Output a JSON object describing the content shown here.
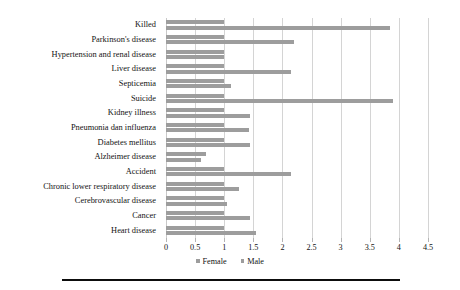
{
  "chart_data": {
    "type": "bar",
    "orientation": "horizontal",
    "title": "",
    "subtitle": "",
    "xlabel": "",
    "ylabel": "",
    "xlim": [
      0,
      4.5
    ],
    "grid": true,
    "legend_position": "bottom",
    "ticks": [
      "0",
      "0.5",
      "1",
      "1.5",
      "2",
      "2.5",
      "3",
      "3.5",
      "4",
      "4.5"
    ],
    "tick_values": [
      0,
      0.5,
      1,
      1.5,
      2,
      2.5,
      3,
      3.5,
      4,
      4.5
    ],
    "categories": [
      "Killed",
      "Parkinson's disease",
      "Hypertension and renal disease",
      "Liver disease",
      "Septicemia",
      "Suicide",
      "Kidney illness",
      "Pneumonia dan influenza",
      "Diabetes mellitus",
      "Alzheimer disease",
      "Accident",
      "Chronic lower respiratory disease",
      "Cerebrovascular disease",
      "Cancer",
      "Heart disease"
    ],
    "series": [
      {
        "name": "Female",
        "color": "#9d9d9d",
        "values": [
          1,
          1,
          1,
          1,
          1,
          1,
          1,
          1,
          1,
          0.68,
          1,
          1,
          1,
          1,
          1
        ]
      },
      {
        "name": "Male",
        "color": "#9d9d9d",
        "values": [
          3.85,
          2.2,
          1.0,
          2.15,
          1.12,
          3.9,
          1.45,
          1.43,
          1.45,
          0.6,
          2.15,
          1.25,
          1.05,
          1.45,
          1.55
        ]
      }
    ]
  },
  "legend": {
    "items": [
      {
        "label": "Female",
        "color": "#9d9d9d"
      },
      {
        "label": "Male",
        "color": "#9d9d9d"
      }
    ]
  },
  "colors": {
    "bar": "#9d9d9d",
    "grid": "#d4d4d4",
    "text": "#131313",
    "rule": "#0d0d0d",
    "background": "#ffffff"
  }
}
